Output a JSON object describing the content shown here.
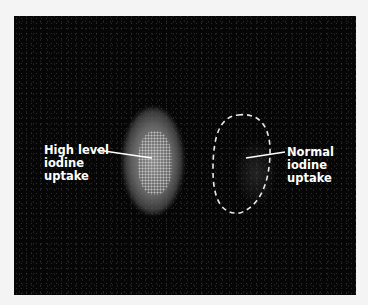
{
  "figure": {
    "background_color": "#060606",
    "page_color": "#f4f4f4",
    "annotations": [
      {
        "id": "high",
        "lines": [
          "High level",
          "iodine",
          "uptake"
        ]
      },
      {
        "id": "normal",
        "lines": [
          "Normal",
          "iodine",
          "uptake"
        ]
      }
    ]
  }
}
